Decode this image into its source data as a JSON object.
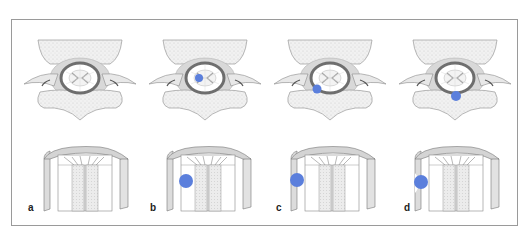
{
  "figure": {
    "panels": [
      {
        "label": "a",
        "lesion": "none"
      },
      {
        "label": "b",
        "lesion": "intramedullary"
      },
      {
        "label": "c",
        "lesion": "intradural-extramedullary"
      },
      {
        "label": "d",
        "lesion": "extradural"
      }
    ],
    "colors": {
      "lesion": "#5b7fdc",
      "frame": "#9a9a9a",
      "bone_fill": "#ececec",
      "dura": "#6e6e6e",
      "cord": "#e6e6e6"
    }
  }
}
